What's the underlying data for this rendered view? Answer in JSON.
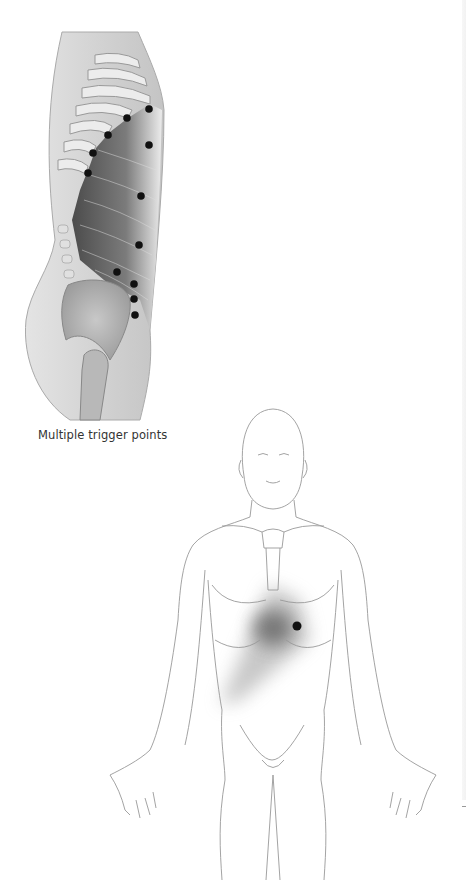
{
  "figure": {
    "side_view": {
      "caption": "Multiple trigger points",
      "trigger_points": [
        {
          "x": 149,
          "y": 109
        },
        {
          "x": 127,
          "y": 118
        },
        {
          "x": 108,
          "y": 135
        },
        {
          "x": 149,
          "y": 145
        },
        {
          "x": 93,
          "y": 153
        },
        {
          "x": 88,
          "y": 173
        },
        {
          "x": 141,
          "y": 196
        },
        {
          "x": 139,
          "y": 245
        },
        {
          "x": 117,
          "y": 272
        },
        {
          "x": 134,
          "y": 284
        },
        {
          "x": 134,
          "y": 299
        },
        {
          "x": 135,
          "y": 315
        }
      ]
    },
    "front_view": {
      "trigger_point": {
        "x": 297,
        "y": 626
      },
      "referred_pain_color": "#555555"
    }
  }
}
